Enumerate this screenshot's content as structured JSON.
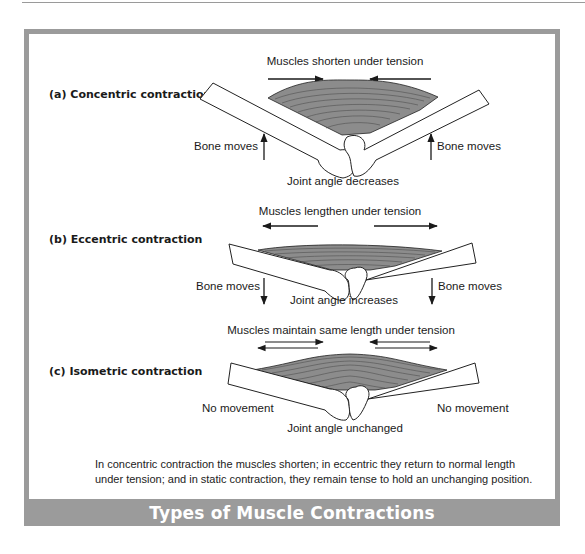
{
  "figure": {
    "title": "Types of Muscle Contractions",
    "caption": "In concentric contraction the muscles shorten; in eccentric they return to normal length under tension; and in static contraction, they remain tense to hold an unchanging position.",
    "colors": {
      "frame": "#9b9b9b",
      "title_text": "#ffffff",
      "muscle_fill": "#8c8c8c",
      "bone_fill": "#ffffff",
      "stroke": "#222222"
    }
  },
  "panels": [
    {
      "label": "(a) Concentric contraction",
      "top_caption": "Muscles shorten under tension",
      "left_note": "Bone moves",
      "right_note": "Bone moves",
      "joint_caption": "Joint angle decreases",
      "muscle_arrows": "inward",
      "bone_arrows": "up"
    },
    {
      "label": "(b) Eccentric contraction",
      "top_caption": "Muscles lengthen under tension",
      "left_note": "Bone moves",
      "right_note": "Bone moves",
      "joint_caption": "Joint angle increases",
      "muscle_arrows": "outward",
      "bone_arrows": "down"
    },
    {
      "label": "(c) Isometric contraction",
      "top_caption": "Muscles maintain same length under tension",
      "left_note": "No movement",
      "right_note": "No movement",
      "joint_caption": "Joint angle unchanged",
      "muscle_arrows": "opposing-pairs",
      "bone_arrows": "none"
    }
  ]
}
